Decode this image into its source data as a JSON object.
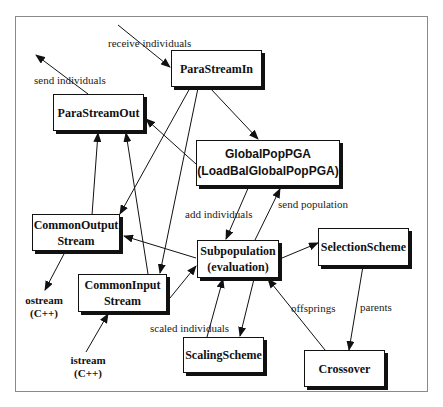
{
  "diagram": {
    "nodes": {
      "para_stream_in": {
        "line1": "ParaStreamIn"
      },
      "para_stream_out": {
        "line1": "ParaStreamOut"
      },
      "global_pop_pga": {
        "line1": "GlobalPopPGA",
        "line2": "(LoadBalGlobalPopPGA)"
      },
      "common_output_stream": {
        "line1": "CommonOutput",
        "line2": "Stream"
      },
      "subpopulation": {
        "line1": "Subpopulation",
        "line2": "(evaluation)"
      },
      "selection_scheme": {
        "line1": "SelectionScheme"
      },
      "common_input_stream": {
        "line1": "CommonInput",
        "line2": "Stream"
      },
      "scaling_scheme": {
        "line1": "ScalingScheme"
      },
      "crossover": {
        "line1": "Crossover"
      }
    },
    "external": {
      "ostream": {
        "line1": "ostream",
        "line2": "(C++)"
      },
      "istream": {
        "line1": "istream",
        "line2": "(C++)"
      }
    },
    "edge_labels": {
      "receive_individuals": "receive individuals",
      "send_individuals": "send individuals",
      "add_individuals": "add individuals",
      "send_population": "send population",
      "scaled_individuals": "scaled individuals",
      "offsprings": "offsprings",
      "parents": "parents"
    }
  }
}
